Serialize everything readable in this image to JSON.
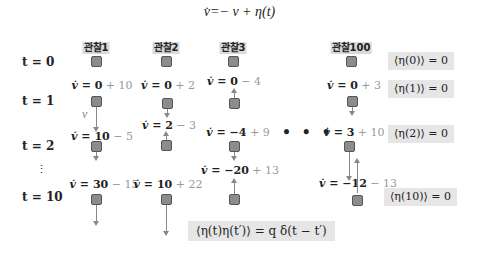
{
  "title": "v̇=− v + η(t)",
  "rows": [
    {
      "label": "t = 0"
    },
    {
      "label": "t = 1"
    },
    {
      "label": "t = 2"
    },
    {
      "label": "⋮"
    },
    {
      "label": "t = 10"
    }
  ],
  "observations": [
    {
      "name": "관찰1",
      "t1": {
        "v": "v̇ = ",
        "base": "0",
        "noise": " + 10"
      },
      "t2": {
        "v": "v̇ = ",
        "base": "10",
        "noise": " − 5"
      },
      "t10": {
        "v": "v̇ = ",
        "base": "30",
        "noise": " − 15"
      }
    },
    {
      "name": "관찰2",
      "t1": {
        "v": "v̇ = ",
        "base": "0",
        "noise": " + 2"
      },
      "t2": {
        "v": "v̇ = ",
        "base": "2",
        "noise": " − 3"
      },
      "t10": {
        "v": "v̇ = ",
        "base": "10",
        "noise": " + 22"
      }
    },
    {
      "name": "관찰3",
      "t1": {
        "v": "v̇ = ",
        "base": "0",
        "noise": " − 4"
      },
      "t2": {
        "v": "v̇ = ",
        "base": "−4",
        "noise": " + 9"
      },
      "t10": {
        "v": "v̇ = ",
        "base": "−20",
        "noise": " + 13"
      }
    },
    {
      "name": "관찰100",
      "t1": {
        "v": "v̇ = ",
        "base": "0",
        "noise": " + 3"
      },
      "t2": {
        "v": "v̇ = ",
        "base": "3",
        "noise": " + 10"
      },
      "t10": {
        "v": "v̇ = ",
        "base": "−12",
        "noise": " − 13"
      }
    }
  ],
  "velocity_label": "v",
  "ellipsis": "• • •",
  "noise_means": [
    {
      "text": "⟨η(0)⟩ = 0"
    },
    {
      "text": "⟨η(1)⟩ = 0"
    },
    {
      "text": "⟨η(2)⟩ = 0"
    },
    {
      "text": "⟨η(10)⟩ = 0"
    }
  ],
  "correlation": "⟨η(t)η(t′)⟩ = q δ(t − t′)",
  "colors": {
    "square_fill": "#8c8c8c",
    "box_bg": "#e6e6e6",
    "noise_text": "#999999",
    "arrow": "#888888"
  }
}
